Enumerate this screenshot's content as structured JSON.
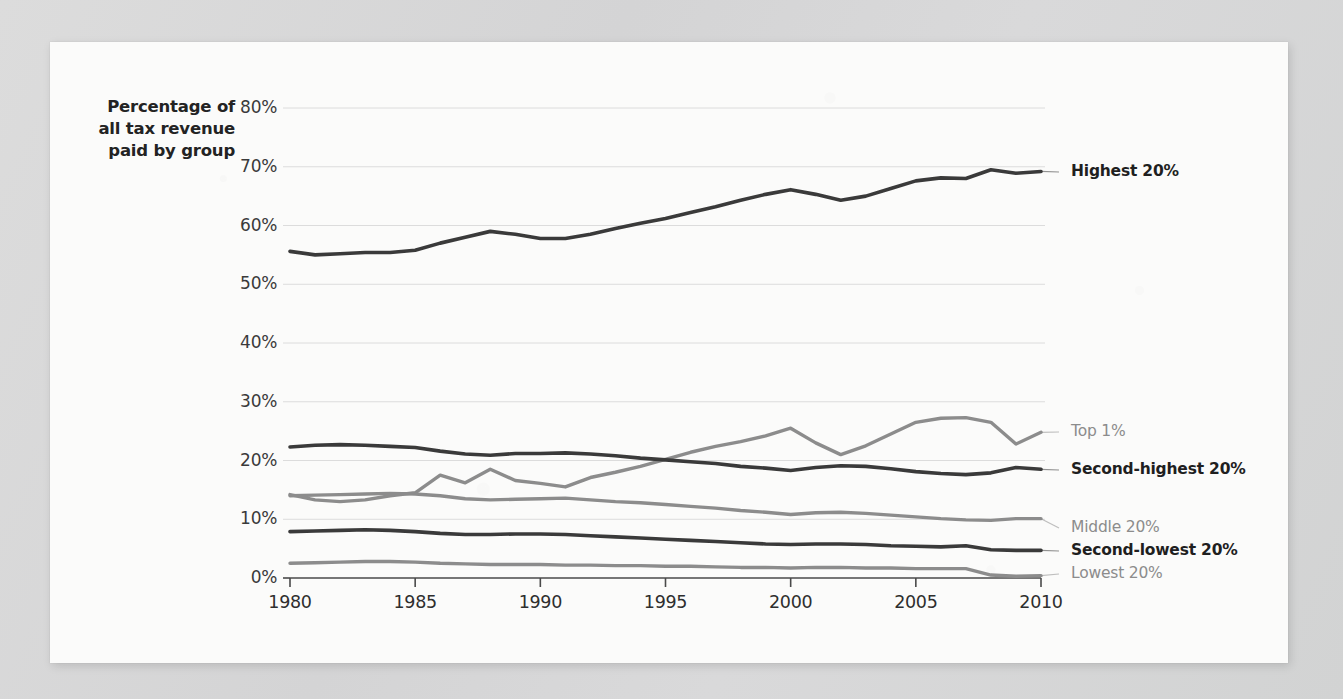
{
  "chart_data": {
    "type": "line",
    "title": "",
    "subtitle": "",
    "ylabel": "Percentage of all tax revenue paid by group",
    "xlabel": "",
    "xlim": [
      1980,
      2010
    ],
    "ylim": [
      0,
      80
    ],
    "grid": true,
    "legend_position": "right-inline",
    "x_ticks": [
      "1980",
      "1985",
      "1990",
      "1995",
      "2000",
      "2005",
      "2010"
    ],
    "x_tick_values": [
      1980,
      1985,
      1990,
      1995,
      2000,
      2005,
      2010
    ],
    "y_ticks": [
      "0%",
      "10%",
      "20%",
      "30%",
      "40%",
      "50%",
      "60%",
      "70%",
      "80%"
    ],
    "y_tick_values": [
      0,
      10,
      20,
      30,
      40,
      50,
      60,
      70,
      80
    ],
    "x": [
      1980,
      1981,
      1982,
      1983,
      1984,
      1985,
      1986,
      1987,
      1988,
      1989,
      1990,
      1991,
      1992,
      1993,
      1994,
      1995,
      1996,
      1997,
      1998,
      1999,
      2000,
      2001,
      2002,
      2003,
      2004,
      2005,
      2006,
      2007,
      2008,
      2009,
      2010
    ],
    "series": [
      {
        "name": "Highest 20%",
        "color": "#3a3a3a",
        "width": 3.6,
        "label_style": "bold",
        "values": [
          55.6,
          55.0,
          55.2,
          55.4,
          55.4,
          55.8,
          57.0,
          58.0,
          59.0,
          58.5,
          57.8,
          57.8,
          58.5,
          59.5,
          60.4,
          61.2,
          62.2,
          63.2,
          64.3,
          65.3,
          66.1,
          65.3,
          64.3,
          65.0,
          66.3,
          67.6,
          68.1,
          68.0,
          69.5,
          68.9,
          69.2
        ]
      },
      {
        "name": "Top 1%",
        "color": "#8c8c8c",
        "width": 3.4,
        "label_style": "light",
        "values": [
          14.2,
          13.3,
          13.0,
          13.3,
          14.0,
          14.5,
          17.5,
          16.2,
          18.5,
          16.6,
          16.1,
          15.5,
          17.1,
          18.0,
          19.0,
          20.2,
          21.4,
          22.4,
          23.2,
          24.2,
          25.5,
          23.0,
          21.0,
          22.5,
          24.5,
          26.5,
          27.2,
          27.3,
          26.5,
          22.8,
          24.8
        ]
      },
      {
        "name": "Second-highest 20%",
        "color": "#3a3a3a",
        "width": 3.6,
        "label_style": "bold",
        "values": [
          22.3,
          22.6,
          22.7,
          22.6,
          22.4,
          22.2,
          21.6,
          21.1,
          20.9,
          21.2,
          21.2,
          21.3,
          21.1,
          20.8,
          20.4,
          20.1,
          19.8,
          19.5,
          19.0,
          18.7,
          18.3,
          18.8,
          19.1,
          19.0,
          18.6,
          18.1,
          17.8,
          17.6,
          17.9,
          18.8,
          18.5
        ]
      },
      {
        "name": "Middle 20%",
        "color": "#8c8c8c",
        "width": 3.4,
        "label_style": "light",
        "values": [
          14.0,
          14.1,
          14.2,
          14.3,
          14.4,
          14.3,
          14.0,
          13.5,
          13.3,
          13.4,
          13.5,
          13.6,
          13.3,
          13.0,
          12.8,
          12.5,
          12.2,
          11.9,
          11.5,
          11.2,
          10.8,
          11.1,
          11.2,
          11.0,
          10.7,
          10.4,
          10.1,
          9.9,
          9.8,
          10.1,
          10.1
        ]
      },
      {
        "name": "Second-lowest 20%",
        "color": "#3a3a3a",
        "width": 3.6,
        "label_style": "bold",
        "values": [
          7.9,
          8.0,
          8.1,
          8.2,
          8.1,
          7.9,
          7.6,
          7.4,
          7.4,
          7.5,
          7.5,
          7.4,
          7.2,
          7.0,
          6.8,
          6.6,
          6.4,
          6.2,
          6.0,
          5.8,
          5.7,
          5.8,
          5.8,
          5.7,
          5.5,
          5.4,
          5.3,
          5.5,
          4.8,
          4.7,
          4.7
        ]
      },
      {
        "name": "Lowest 20%",
        "color": "#8c8c8c",
        "width": 3.4,
        "label_style": "light",
        "values": [
          2.5,
          2.6,
          2.7,
          2.8,
          2.8,
          2.7,
          2.5,
          2.4,
          2.3,
          2.3,
          2.3,
          2.2,
          2.2,
          2.1,
          2.1,
          2.0,
          2.0,
          1.9,
          1.8,
          1.8,
          1.7,
          1.8,
          1.8,
          1.7,
          1.7,
          1.6,
          1.6,
          1.6,
          0.5,
          0.3,
          0.4
        ]
      }
    ]
  },
  "axis_title": {
    "line1": "Percentage of",
    "line2": "all tax revenue",
    "line3": "paid by group"
  },
  "colors": {
    "page_background": "#d7d8d8",
    "card_background": "#fbfbfa",
    "dark_series": "#3a3a3a",
    "light_series": "#8c8c8c",
    "gridline": "#dcdcdc",
    "axis": "#4a4a4a",
    "tick_text": "#3a3a3a"
  }
}
